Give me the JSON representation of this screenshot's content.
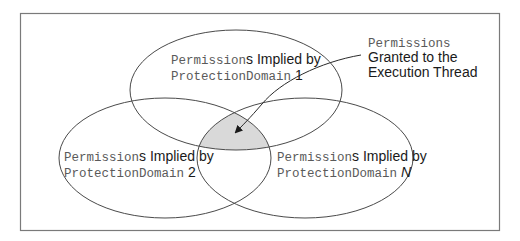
{
  "diagram": {
    "colors": {
      "frame": "#7a7a7a",
      "stroke": "#4a4a4a",
      "intersection_fill": "#d9d9d9",
      "mono_text": "#5a5a5a",
      "sans_text": "#1a1a1a"
    },
    "sets": [
      {
        "id": "pd1",
        "line1_mono": "Permission",
        "line1_sans": "s Implied by",
        "line2_mono": "ProtectionDomain",
        "line2_suffix": " 1"
      },
      {
        "id": "pd2",
        "line1_mono": "Permission",
        "line1_sans": "s Implied by",
        "line2_mono": "ProtectionDomain",
        "line2_suffix": " 2"
      },
      {
        "id": "pdN",
        "line1_mono": "Permission",
        "line1_sans": "s Implied by",
        "line2_mono": "ProtectionDomain",
        "line2_suffix": " N"
      }
    ],
    "callout": {
      "line1_mono": "Permission",
      "line1_sans": "s",
      "line2": "Granted to the",
      "line3": "Execution Thread"
    }
  }
}
